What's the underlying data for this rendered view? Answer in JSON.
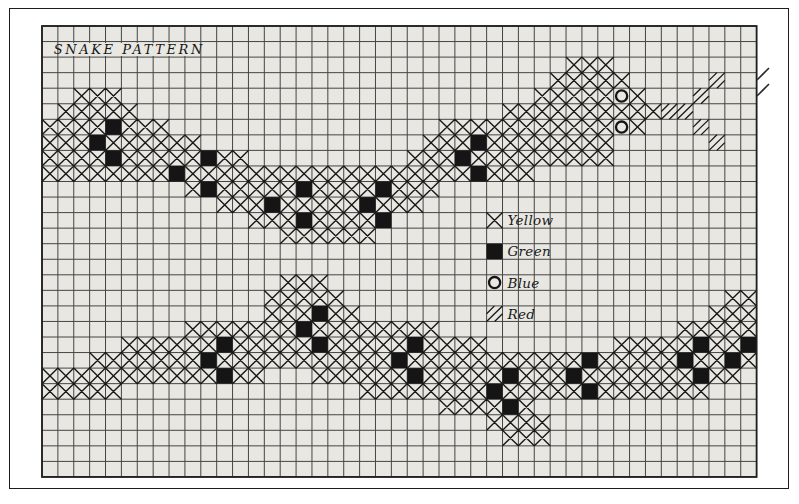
{
  "title": "SNAKE PATTERN",
  "colors": {
    "paper": "#e9e7e1",
    "grid_line": "#454545",
    "grid_border": "#1f1f1f",
    "ink": "#151515"
  },
  "legend": {
    "items": [
      {
        "symbol": "x-cross",
        "label": "Yellow",
        "row": 12,
        "col": 28
      },
      {
        "symbol": "filled-square",
        "label": "Green",
        "row": 14,
        "col": 28
      },
      {
        "symbol": "circle",
        "label": "Blue",
        "row": 16,
        "col": 28
      },
      {
        "symbol": "diagonal-hatch",
        "label": "Red",
        "row": 18,
        "col": 28
      }
    ]
  },
  "chart_data": {
    "type": "heatmap",
    "title": "SNAKE PATTERN",
    "columns": 45,
    "rows": 29,
    "x0": 42,
    "y0": 26,
    "cell_w": 15.88,
    "cell_h": 15.55,
    "cell_codes": {
      ".": "empty",
      "x": "yellow-cross",
      "g": "green-solid",
      "b": "blue-circle",
      "r": "red-hatch"
    },
    "title_box": {
      "row": 1,
      "col_start": 1,
      "col_end": 10
    },
    "grid": [
      ".............................................",
      ".............................................",
      ".................................xxx.........",
      "................................xxxxx.....r..",
      "..xxx..........................xxxxxbx...r...",
      ".xxxxx.......................xxxxxxxxxxrr....",
      "xxxxgxxx.................xxxxxxxxxxxbx...r...",
      "xxxgxxxxxx..............xxxgxxxxxxxx......r..",
      "xxxxgxxxxxgxx..........xxxgxxxxxxxxx.........",
      "xxxxxxxxgxxxxxxxxxxxxxxxxxxgxxx..............",
      ".........xgxxxxxgxxxxgxxx....................",
      "...........xxxgxxxxxgxxx.....................",
      ".............xxxgxxxxg......x................",
      "...............xxxxxx........................",
      "............................g................",
      ".............................................",
      "...............xxx..........b................",
      "..............xxxxx........................xx",
      "..............xxxgxx........r.............xxx",
      ".........xxxxxxxgxxxxxxxx...............xxxxx",
      ".....xxxxxxgxxxxxgxxxxxgxxxx........xxxxxgxxg",
      "...xxxxxxxgxxxxxxxxxxxgxxxxxxxxxxxgxxxxxgxxgx",
      "xxxxxxxxxxxgxx...xxxxxxgxxxxxgxxxgxxxxxxxgxx.",
      "xxxxx...............xxxxxxxxgxxxxxgxxxxxxx...",
      ".........................xxxxgx..............",
      "............................xxxx.............",
      ".............................xxx.............",
      ".............................................",
      "............................................."
    ],
    "edge_marks": [
      {
        "x1": 757,
        "y1": 80,
        "x2": 769,
        "y2": 68
      },
      {
        "x1": 757,
        "y1": 96,
        "x2": 769,
        "y2": 84
      }
    ]
  }
}
